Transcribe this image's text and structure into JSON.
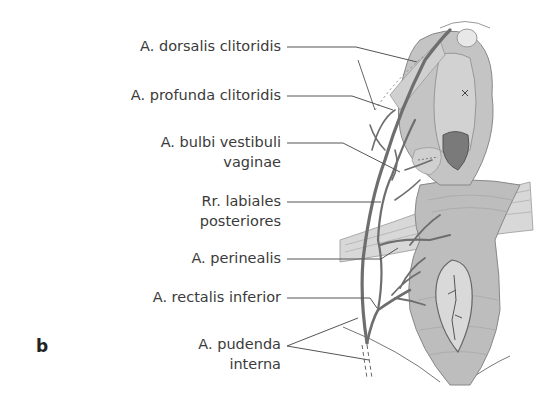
{
  "figure": {
    "panel_letter": "b",
    "labels": [
      {
        "id": "dorsalis",
        "lines": [
          "A. dorsalis clitoridis"
        ]
      },
      {
        "id": "profunda",
        "lines": [
          "A. profunda clitoridis"
        ]
      },
      {
        "id": "bulbi",
        "lines": [
          "A. bulbi vestibuli",
          "vaginae"
        ]
      },
      {
        "id": "labiales",
        "lines": [
          "Rr. labiales",
          "posteriores"
        ]
      },
      {
        "id": "perinealis",
        "lines": [
          "A. perinealis"
        ]
      },
      {
        "id": "rectalis",
        "lines": [
          "A. rectalis inferior"
        ]
      },
      {
        "id": "pudenda",
        "lines": [
          "A. pudenda",
          "interna"
        ]
      }
    ],
    "colors": {
      "tissue": "#c9c9c9",
      "tissue_dark": "#8d8d8d",
      "vessel": "#6e6e6e",
      "leader": "#555555",
      "text": "#3b3b3b"
    }
  }
}
